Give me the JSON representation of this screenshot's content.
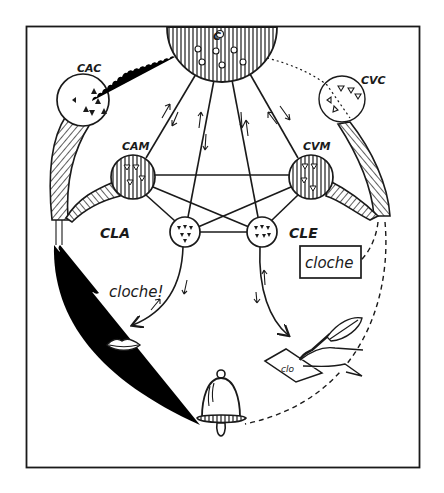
{
  "diagram": {
    "title": "",
    "ink_color": "#1a1a1a",
    "background": "#ffffff",
    "centers": [
      {
        "id": "C",
        "label": "C",
        "description": "central concept centre (hatched half-disc at top)"
      },
      {
        "id": "CAC",
        "label": "CAC",
        "description": "auditory commemorative centre"
      },
      {
        "id": "CVC",
        "label": "CVC",
        "description": "visual commemorative centre"
      },
      {
        "id": "CAM",
        "label": "CAM",
        "description": "auditory motor centre"
      },
      {
        "id": "CVM",
        "label": "CVM",
        "description": "visual motor centre"
      },
      {
        "id": "CLA",
        "label": "CLA",
        "description": "articulated language centre"
      },
      {
        "id": "CLE",
        "label": "CLE",
        "description": "written language centre"
      }
    ],
    "connections": [
      {
        "from": "C",
        "to": "CAM",
        "style": "solid",
        "arrows": "bidirectional"
      },
      {
        "from": "C",
        "to": "CLA",
        "style": "solid",
        "arrows": "bidirectional"
      },
      {
        "from": "C",
        "to": "CLE",
        "style": "solid",
        "arrows": "bidirectional"
      },
      {
        "from": "C",
        "to": "CVM",
        "style": "solid",
        "arrows": "bidirectional"
      },
      {
        "from": "C",
        "to": "CAC",
        "style": "wavy"
      },
      {
        "from": "C",
        "to": "CVC",
        "style": "dotted"
      },
      {
        "from": "CAM",
        "to": "CVM",
        "style": "solid"
      },
      {
        "from": "CAM",
        "to": "CLA",
        "style": "solid"
      },
      {
        "from": "CAM",
        "to": "CLE",
        "style": "solid"
      },
      {
        "from": "CVM",
        "to": "CLA",
        "style": "solid"
      },
      {
        "from": "CVM",
        "to": "CLE",
        "style": "solid"
      },
      {
        "from": "CLA",
        "to": "CLE",
        "style": "solid"
      },
      {
        "from": "CLA",
        "to": "mouth",
        "style": "solid",
        "arrows": "to-mouth"
      },
      {
        "from": "CLE",
        "to": "writing-hand",
        "style": "solid",
        "arrows": "to-hand"
      },
      {
        "from": "CAC",
        "to": "spoken-word",
        "style": "wavy"
      },
      {
        "from": "CAC",
        "to": "bell",
        "style": "wavy"
      },
      {
        "from": "CVC",
        "to": "written-word",
        "style": "dashed"
      },
      {
        "from": "CVC",
        "to": "bell",
        "style": "dashed"
      }
    ],
    "spoken_word": "cloche!",
    "written_word": "cloche",
    "pictograms": [
      {
        "id": "mouth",
        "icon": "lips-icon"
      },
      {
        "id": "bell",
        "icon": "bell-icon"
      },
      {
        "id": "writing-hand",
        "icon": "hand-writing-quill-icon",
        "note_text": "clo"
      }
    ]
  }
}
